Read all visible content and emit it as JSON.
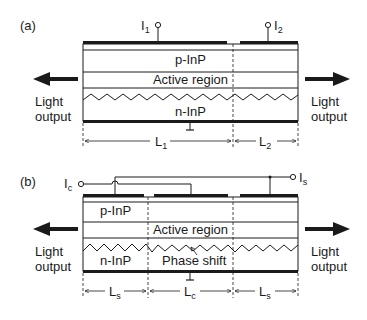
{
  "panel_a": {
    "label": "(a)",
    "current_1": {
      "main": "I",
      "sub": "1"
    },
    "current_2": {
      "main": "I",
      "sub": "2"
    },
    "layer_p": "p-InP",
    "layer_active": "Active region",
    "layer_n": "n-InP",
    "light_left": [
      "Light",
      "output"
    ],
    "light_right": [
      "Light",
      "output"
    ],
    "length_1": {
      "main": "L",
      "sub": "1"
    },
    "length_2": {
      "main": "L",
      "sub": "2"
    }
  },
  "panel_b": {
    "label": "(b)",
    "current_c": {
      "main": "I",
      "sub": "c"
    },
    "current_s": {
      "main": "I",
      "sub": "s"
    },
    "layer_p": "p-InP",
    "layer_active": "Active region",
    "layer_n": "n-InP",
    "phase_shift": "Phase shift",
    "light_left": [
      "Light",
      "output"
    ],
    "light_right": [
      "Light",
      "output"
    ],
    "length_s_left": {
      "main": "L",
      "sub": "s"
    },
    "length_c": {
      "main": "L",
      "sub": "c"
    },
    "length_s_right": {
      "main": "L",
      "sub": "s"
    }
  }
}
